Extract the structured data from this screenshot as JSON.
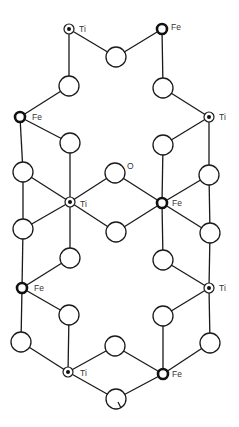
{
  "diagram": {
    "type": "crystal-structure",
    "labels": {
      "ti": "Ti",
      "fe": "Fe",
      "o": "O"
    },
    "colors": {
      "line": "#1a1a1a",
      "background": "#ffffff"
    },
    "atoms": {
      "ti": [
        {
          "id": "ti1",
          "x": 69,
          "y": 29,
          "label_dx": 10,
          "label_dy": 0
        },
        {
          "id": "ti2",
          "x": 209,
          "y": 117,
          "label_dx": 10,
          "label_dy": 0
        },
        {
          "id": "ti3",
          "x": 70,
          "y": 202,
          "label_dx": 10,
          "label_dy": 2
        },
        {
          "id": "ti4",
          "x": 209,
          "y": 288,
          "label_dx": 10,
          "label_dy": 0
        },
        {
          "id": "ti5",
          "x": 68,
          "y": 372,
          "label_dx": 12,
          "label_dy": 1
        }
      ],
      "fe": [
        {
          "id": "fe1",
          "x": 162,
          "y": 29,
          "label_dx": 9,
          "label_dy": -2
        },
        {
          "id": "fe2",
          "x": 20,
          "y": 117,
          "label_dx": 12,
          "label_dy": 0
        },
        {
          "id": "fe3",
          "x": 162,
          "y": 203,
          "label_dx": 10,
          "label_dy": 0
        },
        {
          "id": "fe4",
          "x": 22,
          "y": 288,
          "label_dx": 12,
          "label_dy": 0
        },
        {
          "id": "fe5",
          "x": 163,
          "y": 374,
          "label_dx": 9,
          "label_dy": 0
        }
      ],
      "o": [
        {
          "id": "o1",
          "x": 116,
          "y": 57
        },
        {
          "id": "o2",
          "x": 69,
          "y": 86
        },
        {
          "id": "o3",
          "x": 163,
          "y": 88
        },
        {
          "id": "o4",
          "x": 70,
          "y": 143
        },
        {
          "id": "o5",
          "x": 163,
          "y": 145
        },
        {
          "id": "o6",
          "x": 23,
          "y": 172
        },
        {
          "id": "o7",
          "x": 115,
          "y": 173,
          "labeled": true
        },
        {
          "id": "o8",
          "x": 209,
          "y": 175
        },
        {
          "id": "o9",
          "x": 23,
          "y": 229
        },
        {
          "id": "o10",
          "x": 116,
          "y": 232
        },
        {
          "id": "o11",
          "x": 210,
          "y": 233
        },
        {
          "id": "o12",
          "x": 70,
          "y": 258
        },
        {
          "id": "o13",
          "x": 163,
          "y": 260
        },
        {
          "id": "o14",
          "x": 69,
          "y": 315
        },
        {
          "id": "o15",
          "x": 163,
          "y": 316
        },
        {
          "id": "o16",
          "x": 21,
          "y": 342
        },
        {
          "id": "o17",
          "x": 115,
          "y": 346
        },
        {
          "id": "o18",
          "x": 210,
          "y": 343
        },
        {
          "id": "o19",
          "x": 116,
          "y": 399
        }
      ]
    },
    "bonds": [
      [
        "ti1",
        "o1"
      ],
      [
        "o1",
        "fe1"
      ],
      [
        "ti1",
        "o2"
      ],
      [
        "fe1",
        "o3"
      ],
      [
        "o2",
        "fe2"
      ],
      [
        "o3",
        "ti2"
      ],
      [
        "fe2",
        "o6"
      ],
      [
        "fe2",
        "o4"
      ],
      [
        "ti2",
        "o5"
      ],
      [
        "ti2",
        "o8"
      ],
      [
        "o4",
        "ti3"
      ],
      [
        "o6",
        "ti3"
      ],
      [
        "o7",
        "ti3"
      ],
      [
        "o9",
        "ti3"
      ],
      [
        "o10",
        "ti3"
      ],
      [
        "o12",
        "ti3"
      ],
      [
        "o5",
        "fe3"
      ],
      [
        "o7",
        "fe3"
      ],
      [
        "o8",
        "fe3"
      ],
      [
        "o10",
        "fe3"
      ],
      [
        "o11",
        "fe3"
      ],
      [
        "o13",
        "fe3"
      ],
      [
        "o6",
        "o9"
      ],
      [
        "o8",
        "o11"
      ],
      [
        "o9",
        "fe4"
      ],
      [
        "o12",
        "fe4"
      ],
      [
        "o11",
        "ti4"
      ],
      [
        "o13",
        "ti4"
      ],
      [
        "fe4",
        "o14"
      ],
      [
        "fe4",
        "o16"
      ],
      [
        "ti4",
        "o15"
      ],
      [
        "ti4",
        "o18"
      ],
      [
        "o14",
        "ti5"
      ],
      [
        "o16",
        "ti5"
      ],
      [
        "o15",
        "fe5"
      ],
      [
        "o18",
        "fe5"
      ],
      [
        "ti5",
        "o17"
      ],
      [
        "o17",
        "fe5"
      ],
      [
        "ti5",
        "o19"
      ],
      [
        "o19",
        "fe5"
      ]
    ]
  }
}
